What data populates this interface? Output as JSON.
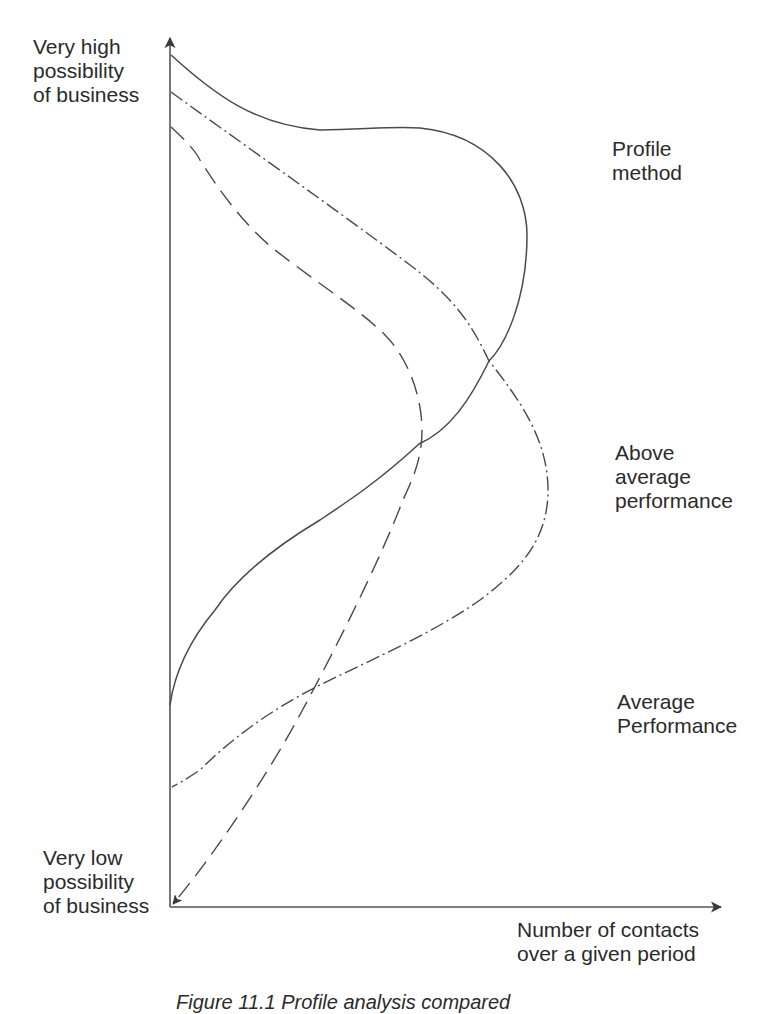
{
  "figure": {
    "y_axis": {
      "top_label": "Very high\npossibility\nof business",
      "bottom_label": "Very low\npossibility\nof business"
    },
    "x_axis": {
      "label": "Number of contacts\nover a given period"
    },
    "curve_labels": {
      "profile": "Profile\nmethod",
      "above": "Above\naverage\nperformance",
      "average": "Average\nPerformance"
    },
    "caption": "Figure 11.1  Profile analysis compared"
  },
  "legend": [
    {
      "name": "Profile method",
      "line_style": "solid"
    },
    {
      "name": "Above average performance",
      "line_style": "dash-dot"
    },
    {
      "name": "Average Performance",
      "line_style": "dashed"
    }
  ],
  "colors": {
    "ink": "#4a4a4a",
    "background": "#ffffff"
  }
}
